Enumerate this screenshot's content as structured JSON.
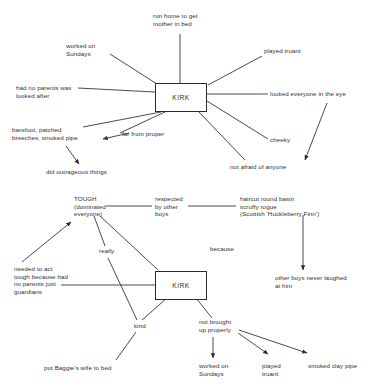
{
  "document": {
    "title": "Kirk character mind maps",
    "ink_color": "#2b2b2b",
    "background_color": "#ffffff"
  },
  "diagrams": [
    {
      "id": "top-map",
      "center": {
        "label": "KIRK"
      },
      "nodes": [
        {
          "id": "run-home",
          "label": "run home to get\nmother in bed"
        },
        {
          "id": "worked-sundays",
          "label": "worked on\nSundays"
        },
        {
          "id": "played-truant",
          "label": "played truant"
        },
        {
          "id": "no-parents",
          "label": "had no parents was\nlooked after"
        },
        {
          "id": "looked-everyone",
          "label": "looked everyone in the eye"
        },
        {
          "id": "barefoot",
          "label": "barefoot, patched\nbreeches, smoked pipe"
        },
        {
          "id": "far-from-proper",
          "label": "far from proper"
        },
        {
          "id": "cheeky",
          "label": "cheeky"
        },
        {
          "id": "did-outrageous",
          "label": "did outrageous things"
        },
        {
          "id": "not-afraid",
          "label": "not afraid of anyone"
        }
      ]
    },
    {
      "id": "bottom-map",
      "center": {
        "label": "KIRK"
      },
      "nodes": [
        {
          "id": "tough",
          "label": "TOUGH\n(dominated\neveryone)"
        },
        {
          "id": "respected",
          "label": "respected\nby other\nboys"
        },
        {
          "id": "haircut",
          "label": "haircut round basin\nscruffy rogue\n(Scottish 'Huckleberry Finn')"
        },
        {
          "id": "really",
          "label": "really"
        },
        {
          "id": "because",
          "label": "because"
        },
        {
          "id": "needed-tough",
          "label": "needed to act\ntough because had\nno parents just\nguardians"
        },
        {
          "id": "never-laughed",
          "label": "other boys never laughed\nat him"
        },
        {
          "id": "kind",
          "label": "kind"
        },
        {
          "id": "not-brought-up",
          "label": "not brought\nup properly"
        },
        {
          "id": "baggie",
          "label": "put Baggie's wife to bed"
        },
        {
          "id": "worked-sundays-2",
          "label": "worked on\nSundays"
        },
        {
          "id": "played-truant-2",
          "label": "played\ntruant"
        },
        {
          "id": "smoked-pipe",
          "label": "smoked clay pipe"
        }
      ]
    }
  ]
}
